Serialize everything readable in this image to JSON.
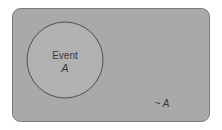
{
  "diagram": {
    "type": "venn",
    "universe": {
      "fill": "#a9a9a9",
      "stroke": "#6e6e6e"
    },
    "circle": {
      "label_line1": "Event",
      "label_line2": "A",
      "fill": "#b0b0b0",
      "stroke": "#3a3a3a"
    },
    "complement_label": "~ A"
  }
}
